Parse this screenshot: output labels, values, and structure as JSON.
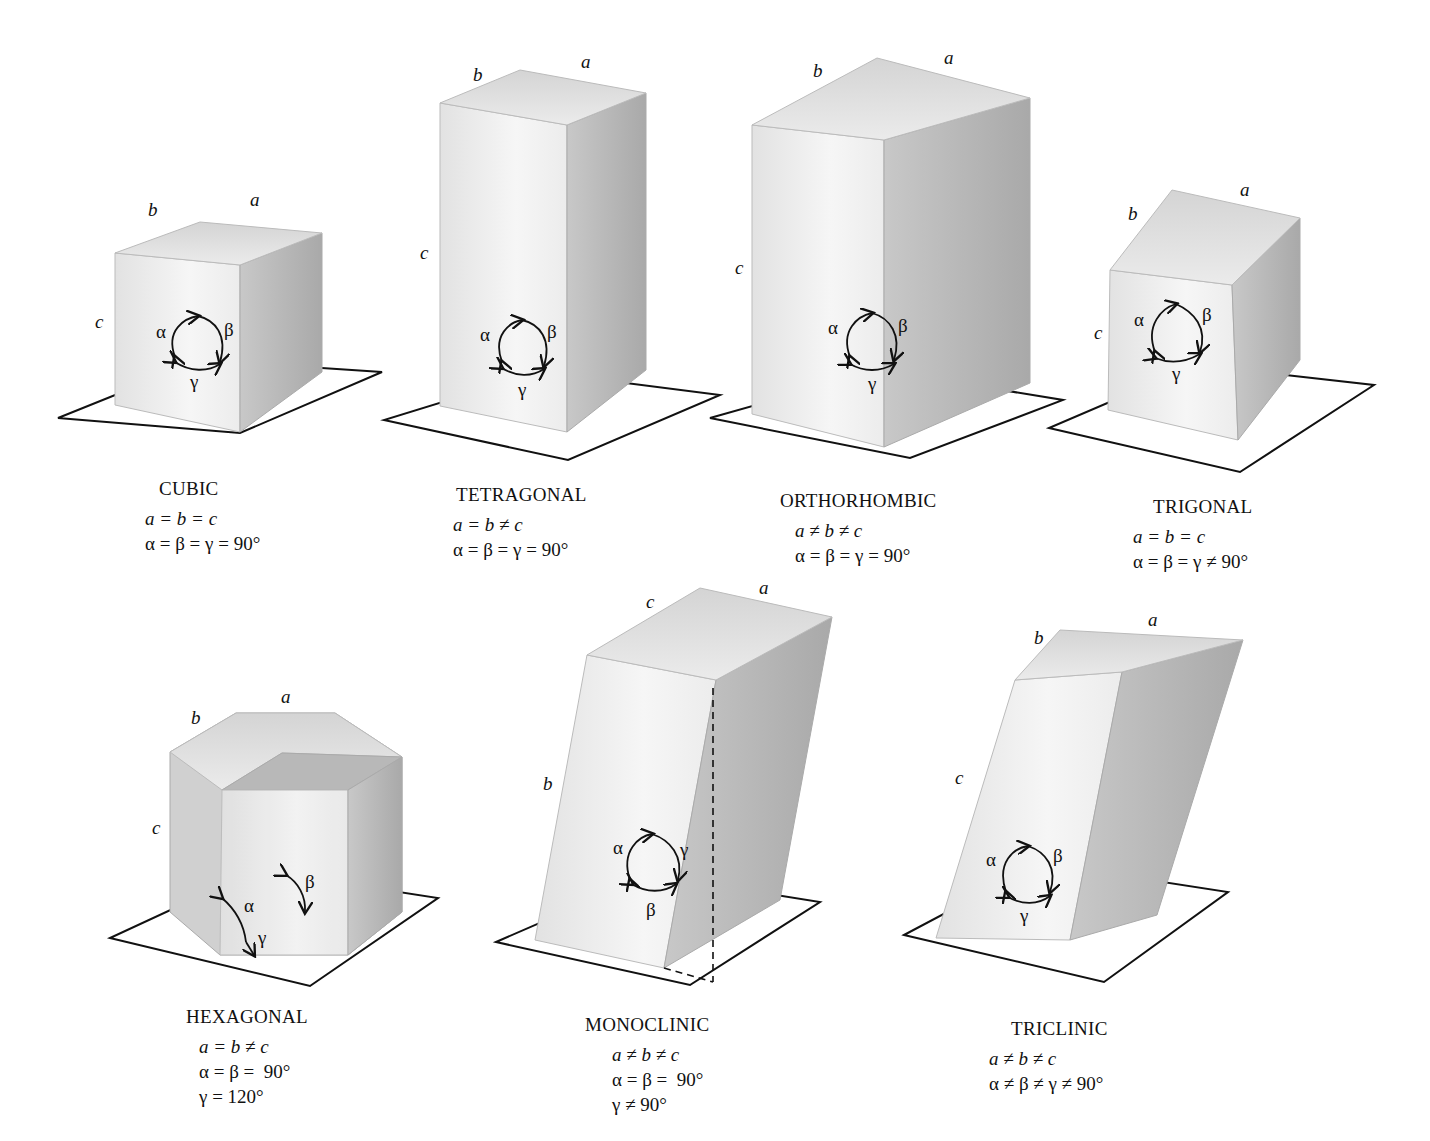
{
  "figure": {
    "systems": [
      {
        "id": "cubic",
        "name": "CUBIC",
        "lengths": "a = b = c",
        "angles": "α = β = γ = 90°",
        "edge_labels": {
          "a": "a",
          "b": "b",
          "c": "c"
        },
        "angle_labels": {
          "alpha": "α",
          "beta": "β",
          "gamma": "γ"
        }
      },
      {
        "id": "tetragonal",
        "name": "TETRAGONAL",
        "lengths": "a = b ≠ c",
        "angles": "α = β = γ = 90°",
        "edge_labels": {
          "a": "a",
          "b": "b",
          "c": "c"
        },
        "angle_labels": {
          "alpha": "α",
          "beta": "β",
          "gamma": "γ"
        }
      },
      {
        "id": "orthorhombic",
        "name": "ORTHORHOMBIC",
        "lengths": "a ≠ b ≠ c",
        "angles": "α = β = γ = 90°",
        "edge_labels": {
          "a": "a",
          "b": "b",
          "c": "c"
        },
        "angle_labels": {
          "alpha": "α",
          "beta": "β",
          "gamma": "γ"
        }
      },
      {
        "id": "trigonal",
        "name": "TRIGONAL",
        "lengths": "a = b = c",
        "angles": "α = β = γ ≠ 90°",
        "edge_labels": {
          "a": "a",
          "b": "b",
          "c": "c"
        },
        "angle_labels": {
          "alpha": "α",
          "beta": "β",
          "gamma": "γ"
        }
      },
      {
        "id": "hexagonal",
        "name": "HEXAGONAL",
        "lengths": "a = b ≠ c",
        "angles": "α = β =  90°",
        "angles2": "γ = 120°",
        "edge_labels": {
          "a": "a",
          "b": "b",
          "c": "c"
        },
        "angle_labels": {
          "alpha": "α",
          "beta": "β",
          "gamma": "γ"
        }
      },
      {
        "id": "monoclinic",
        "name": "MONOCLINIC",
        "lengths": "a ≠ b ≠ c",
        "angles": "α = β =  90°",
        "angles2": "γ ≠ 90°",
        "edge_labels": {
          "a": "a",
          "b": "b",
          "c": "c"
        },
        "angle_labels": {
          "alpha": "α",
          "beta": "β",
          "gamma": "γ"
        }
      },
      {
        "id": "triclinic",
        "name": "TRICLINIC",
        "lengths": "a ≠ b ≠ c",
        "angles": "α ≠ β ≠ γ ≠ 90°",
        "edge_labels": {
          "a": "a",
          "b": "b",
          "c": "c"
        },
        "angle_labels": {
          "alpha": "α",
          "beta": "β",
          "gamma": "γ"
        }
      }
    ]
  }
}
